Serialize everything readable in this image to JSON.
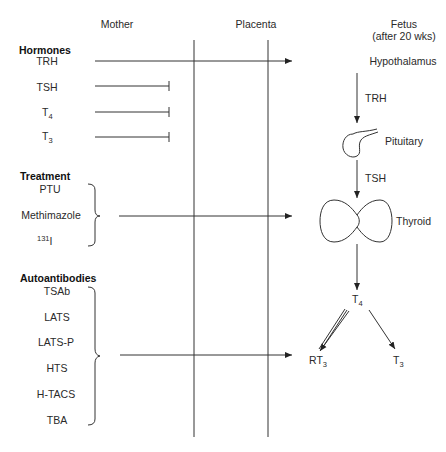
{
  "columns": {
    "mother": "Mother",
    "placenta": "Placenta",
    "fetus": "Fetus",
    "fetus_note": "(after 20 wks)"
  },
  "hormones": {
    "heading": "Hormones",
    "items": [
      {
        "label": "TRH",
        "crosses_placenta": true
      },
      {
        "label": "TSH",
        "crosses_placenta": false
      },
      {
        "label": "T",
        "sub": "4",
        "crosses_placenta": false
      },
      {
        "label": "T",
        "sub": "3",
        "crosses_placenta": false
      }
    ]
  },
  "treatment": {
    "heading": "Treatment",
    "items": [
      {
        "label": "PTU"
      },
      {
        "label": "Methimazole"
      },
      {
        "label": "I",
        "sup": "131"
      }
    ],
    "target": "Thyroid"
  },
  "autoantibodies": {
    "heading": "Autoantibodies",
    "items": [
      {
        "label": "TSAb"
      },
      {
        "label": "LATS"
      },
      {
        "label": "LATS-P"
      },
      {
        "label": "HTS"
      },
      {
        "label": "H-TACS"
      },
      {
        "label": "TBA"
      }
    ],
    "target": "RT3"
  },
  "fetal_axis": {
    "hypothalamus": "Hypothalamus",
    "trh_label": "TRH",
    "pituitary": "Pituitary",
    "tsh_label": "TSH",
    "thyroid": "Thyroid",
    "t4": {
      "label": "T",
      "sub": "4"
    },
    "rt3": {
      "label": "RT",
      "sub": "3"
    },
    "t3": {
      "label": "T",
      "sub": "3"
    }
  },
  "colors": {
    "ink": "#333333",
    "text": "#2a2a2a",
    "background": "#ffffff"
  }
}
